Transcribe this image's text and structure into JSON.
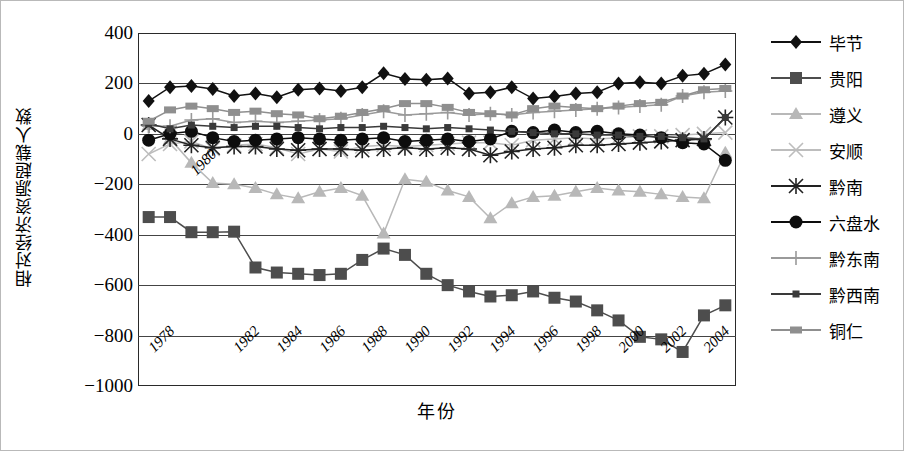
{
  "chart_data": {
    "type": "line",
    "title": "",
    "xlabel": "年份",
    "ylabel": "相对经济资源超载人数",
    "xlim": [
      1977.5,
      2005.5
    ],
    "ylim": [
      -1000,
      400
    ],
    "ytick_step": 200,
    "grid": "horizontal",
    "legend_position": "right",
    "yticks": [
      400,
      200,
      0,
      -200,
      -400,
      -600,
      -800,
      -1000
    ],
    "ytick_labels": [
      "400",
      "200",
      "0",
      "−200",
      "−400",
      "−600",
      "−800",
      "−1000"
    ],
    "x": [
      1978,
      1979,
      1980,
      1981,
      1982,
      1983,
      1984,
      1985,
      1986,
      1987,
      1988,
      1989,
      1990,
      1991,
      1992,
      1993,
      1994,
      1995,
      1996,
      1997,
      1998,
      1999,
      2000,
      2001,
      2002,
      2003,
      2004,
      2005
    ],
    "xtick_labels": [
      "1978",
      "1980",
      "1982",
      "1984",
      "1986",
      "1988",
      "1990",
      "1992",
      "1994",
      "1996",
      "1998",
      "2000",
      "2002",
      "2004"
    ],
    "xticks": [
      1978,
      1980,
      1982,
      1984,
      1986,
      1988,
      1990,
      1992,
      1994,
      1996,
      1998,
      2000,
      2002,
      2004
    ],
    "series": [
      {
        "name": "毕节",
        "marker": "diamond",
        "color": "#111111",
        "values": [
          130,
          185,
          190,
          178,
          150,
          160,
          145,
          175,
          180,
          170,
          185,
          240,
          218,
          215,
          220,
          160,
          165,
          185,
          140,
          148,
          160,
          165,
          200,
          205,
          200,
          230,
          238,
          275
        ]
      },
      {
        "name": "贵阳",
        "marker": "square",
        "color": "#4d4d4d",
        "values": [
          -330,
          -330,
          -390,
          -390,
          -388,
          -530,
          -550,
          -555,
          -560,
          -555,
          -500,
          -455,
          -480,
          -555,
          -600,
          -625,
          -645,
          -640,
          -625,
          -650,
          -665,
          -700,
          -740,
          -805,
          -815,
          -865,
          -720,
          -680
        ]
      },
      {
        "name": "遵义",
        "marker": "triangle",
        "color": "#b8b8b8",
        "values": [
          35,
          -20,
          -115,
          -195,
          -200,
          -215,
          -240,
          -255,
          -230,
          -215,
          -245,
          -395,
          -180,
          -190,
          -225,
          -250,
          -335,
          -275,
          -250,
          -245,
          -230,
          -215,
          -225,
          -230,
          -240,
          -250,
          -255,
          -75
        ]
      },
      {
        "name": "安顺",
        "marker": "x",
        "color": "#bdbdbd",
        "values": [
          -80,
          -40,
          -30,
          -60,
          -45,
          -40,
          -55,
          -80,
          -60,
          -70,
          -50,
          -45,
          -50,
          -45,
          -40,
          -35,
          -35,
          -45,
          -25,
          -20,
          -15,
          -20,
          -15,
          -10,
          -10,
          -5,
          0,
          5
        ]
      },
      {
        "name": "黔南",
        "marker": "asterisk",
        "color": "#222222",
        "values": [
          35,
          -20,
          -45,
          -55,
          -50,
          -50,
          -60,
          -65,
          -60,
          -60,
          -65,
          -60,
          -55,
          -60,
          -55,
          -60,
          -85,
          -70,
          -60,
          -55,
          -45,
          -45,
          -40,
          -35,
          -30,
          -25,
          -20,
          65
        ]
      },
      {
        "name": "六盘水",
        "marker": "circle",
        "color": "#0d0d0d",
        "values": [
          -25,
          0,
          10,
          -15,
          -30,
          -25,
          -20,
          -15,
          -20,
          -25,
          -20,
          -15,
          -30,
          -25,
          -20,
          -30,
          -20,
          10,
          5,
          15,
          5,
          10,
          0,
          -5,
          -15,
          -35,
          -40,
          -105
        ]
      },
      {
        "name": "黔东南",
        "marker": "plus",
        "color": "#9a9a9a",
        "values": [
          30,
          30,
          55,
          60,
          45,
          50,
          45,
          50,
          55,
          60,
          75,
          90,
          75,
          80,
          85,
          75,
          80,
          75,
          85,
          90,
          95,
          100,
          105,
          110,
          115,
          150,
          165,
          170
        ]
      },
      {
        "name": "黔西南",
        "marker": "small-square",
        "color": "#3a3a3a",
        "values": [
          40,
          20,
          35,
          30,
          25,
          30,
          30,
          25,
          20,
          25,
          25,
          30,
          25,
          20,
          25,
          20,
          15,
          10,
          5,
          0,
          0,
          -5,
          -5,
          -10,
          -10,
          -15,
          -20,
          65
        ]
      },
      {
        "name": "铜仁",
        "marker": "wide-square",
        "color": "#8f8f8f",
        "values": [
          50,
          95,
          110,
          100,
          85,
          90,
          80,
          75,
          60,
          70,
          85,
          100,
          120,
          120,
          105,
          85,
          80,
          75,
          100,
          110,
          105,
          100,
          110,
          120,
          125,
          150,
          175,
          180
        ]
      }
    ]
  }
}
